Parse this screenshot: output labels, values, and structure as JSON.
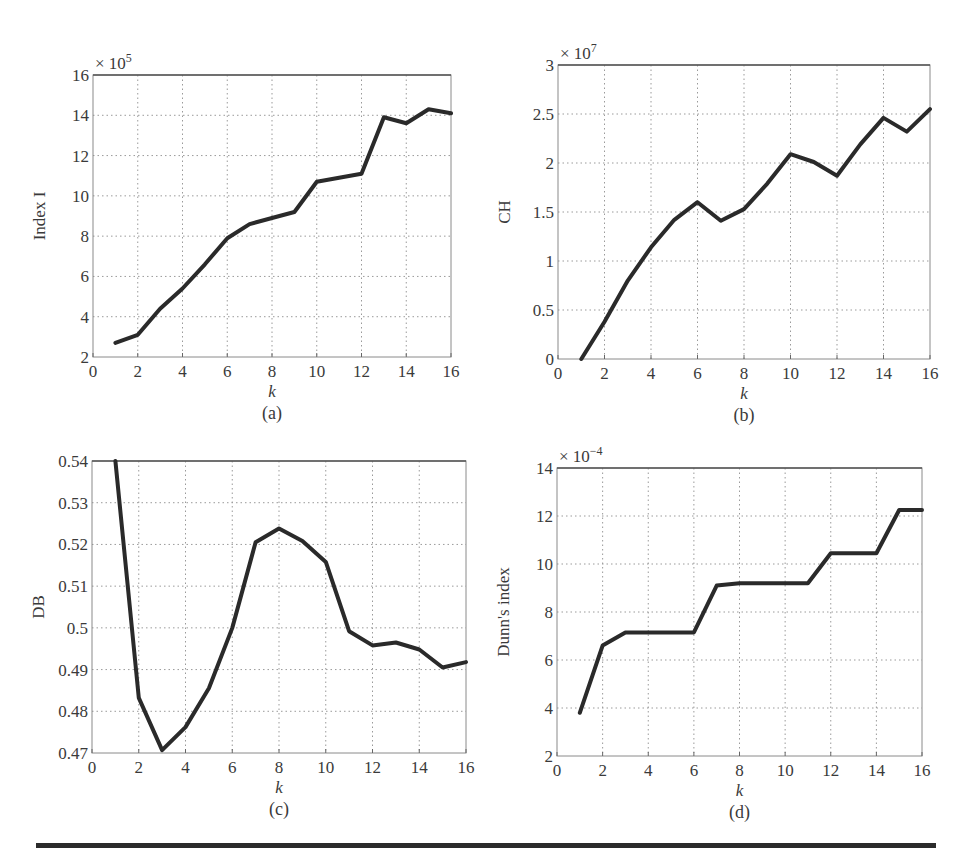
{
  "chart_data": [
    {
      "id": "a",
      "type": "line",
      "caption": "(a)",
      "title": "",
      "xlabel": "k",
      "ylabel": "Index I",
      "y_multiplier": "× 10^5",
      "y_exponent": "5",
      "xlim": [
        0,
        16
      ],
      "ylim": [
        2,
        16
      ],
      "xticks": [
        0,
        2,
        4,
        6,
        8,
        10,
        12,
        14,
        16
      ],
      "yticks": [
        2,
        4,
        6,
        8,
        10,
        12,
        14,
        16
      ],
      "grid": true,
      "x": [
        1,
        2,
        3,
        4,
        5,
        6,
        7,
        8,
        9,
        10,
        11,
        12,
        13,
        14,
        15,
        16
      ],
      "series": [
        {
          "name": "Index I",
          "values": [
            2.7,
            3.1,
            4.4,
            5.4,
            6.6,
            7.9,
            8.6,
            8.9,
            9.2,
            10.7,
            10.9,
            11.1,
            13.9,
            13.6,
            14.3,
            14.1
          ]
        }
      ],
      "plot_box": {
        "left": 93,
        "right": 451,
        "top": 75,
        "bottom": 357
      }
    },
    {
      "id": "b",
      "type": "line",
      "caption": "(b)",
      "title": "",
      "xlabel": "k",
      "ylabel": "CH",
      "y_multiplier": "× 10^7",
      "y_exponent": "7",
      "xlim": [
        0,
        16
      ],
      "ylim": [
        0,
        3
      ],
      "xticks": [
        0,
        2,
        4,
        6,
        8,
        10,
        12,
        14,
        16
      ],
      "yticks": [
        0,
        0.5,
        1,
        1.5,
        2,
        2.5,
        3
      ],
      "ytick_labels": [
        "0",
        "0.5",
        "1",
        "1.5",
        "2",
        "2.5",
        "3"
      ],
      "grid": true,
      "x": [
        1,
        2,
        3,
        4,
        5,
        6,
        7,
        8,
        9,
        10,
        11,
        12,
        13,
        14,
        15,
        16
      ],
      "series": [
        {
          "name": "CH",
          "values": [
            0.0,
            0.38,
            0.8,
            1.14,
            1.42,
            1.6,
            1.41,
            1.53,
            1.79,
            2.09,
            2.01,
            1.87,
            2.19,
            2.46,
            2.32,
            2.55
          ]
        }
      ],
      "plot_box": {
        "left": 558,
        "right": 930,
        "top": 65,
        "bottom": 359
      }
    },
    {
      "id": "c",
      "type": "line",
      "caption": "(c)",
      "title": "",
      "xlabel": "k",
      "ylabel": "DB",
      "xlim": [
        0,
        16
      ],
      "ylim": [
        0.47,
        0.54
      ],
      "xticks": [
        0,
        2,
        4,
        6,
        8,
        10,
        12,
        14,
        16
      ],
      "yticks": [
        0.47,
        0.48,
        0.49,
        0.5,
        0.51,
        0.52,
        0.53,
        0.54
      ],
      "ytick_labels": [
        "0.47",
        "0.48",
        "0.49",
        "0.5",
        "0.51",
        "0.52",
        "0.53",
        "0.54"
      ],
      "grid": true,
      "x": [
        1,
        2,
        3,
        4,
        5,
        6,
        7,
        8,
        9,
        10,
        11,
        12,
        13,
        14,
        15,
        16
      ],
      "series": [
        {
          "name": "DB",
          "values": [
            0.54,
            0.4832,
            0.4707,
            0.4762,
            0.4855,
            0.5,
            0.5205,
            0.5238,
            0.5208,
            0.5158,
            0.4992,
            0.4958,
            0.4965,
            0.4948,
            0.4905,
            0.4918
          ]
        }
      ],
      "plot_box": {
        "left": 92,
        "right": 466,
        "top": 461,
        "bottom": 753
      }
    },
    {
      "id": "d",
      "type": "line",
      "caption": "(d)",
      "title": "",
      "xlabel": "k",
      "ylabel": "Dunn's index",
      "y_multiplier": "× 10^-4",
      "y_exponent": "−4",
      "xlim": [
        0,
        16
      ],
      "ylim": [
        2,
        14
      ],
      "xticks": [
        0,
        2,
        4,
        6,
        8,
        10,
        12,
        14,
        16
      ],
      "yticks": [
        2,
        4,
        6,
        8,
        10,
        12,
        14
      ],
      "grid": true,
      "x": [
        1,
        2,
        3,
        4,
        5,
        6,
        7,
        8,
        9,
        10,
        11,
        12,
        13,
        14,
        15,
        16
      ],
      "series": [
        {
          "name": "Dunn's index",
          "values": [
            3.8,
            6.6,
            7.15,
            7.15,
            7.15,
            7.15,
            9.1,
            9.2,
            9.2,
            9.2,
            9.2,
            10.45,
            10.45,
            10.45,
            12.25,
            12.25
          ]
        }
      ],
      "plot_box": {
        "left": 557,
        "right": 922,
        "top": 468,
        "bottom": 756
      }
    }
  ],
  "figure": {
    "rule": {
      "x1": 36,
      "x2": 936,
      "y": 843,
      "height": 5
    }
  }
}
